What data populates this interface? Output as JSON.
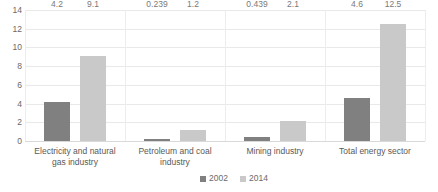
{
  "chart_data": {
    "type": "bar",
    "title": "",
    "subtitle": "",
    "xlabel": "",
    "ylabel": "",
    "categories": [
      "Electricity and natural gas industry",
      "Petroleum and coal industry",
      "Mining industry",
      "Total energy sector"
    ],
    "series": [
      {
        "name": "2002",
        "color": "#808080",
        "values": [
          4.2,
          0.239,
          0.439,
          4.6
        ]
      },
      {
        "name": "2014",
        "color": "#c9c9c9",
        "values": [
          9.1,
          1.2,
          2.1,
          12.5
        ]
      }
    ],
    "value_labels": [
      [
        "4.2",
        "0.239",
        "0.439",
        "4.6"
      ],
      [
        "9.1",
        "1.2",
        "2.1",
        "12.5"
      ]
    ],
    "ylim": [
      0,
      14
    ],
    "yticks": [
      0,
      2,
      4,
      6,
      8,
      10,
      12,
      14
    ],
    "ytick_labels": [
      "0",
      "2",
      "4",
      "6",
      "8",
      "10",
      "12",
      "14"
    ],
    "grid": {
      "horizontal": true,
      "vertical": true
    },
    "legend": {
      "position": "bottom",
      "entries": [
        "2002",
        "2014"
      ]
    },
    "colors": {
      "series_2002": "#808080",
      "series_2014": "#c9c9c9",
      "gridline": "#e9e9e9",
      "text": "#6a6a6a",
      "background": "#ffffff"
    }
  }
}
